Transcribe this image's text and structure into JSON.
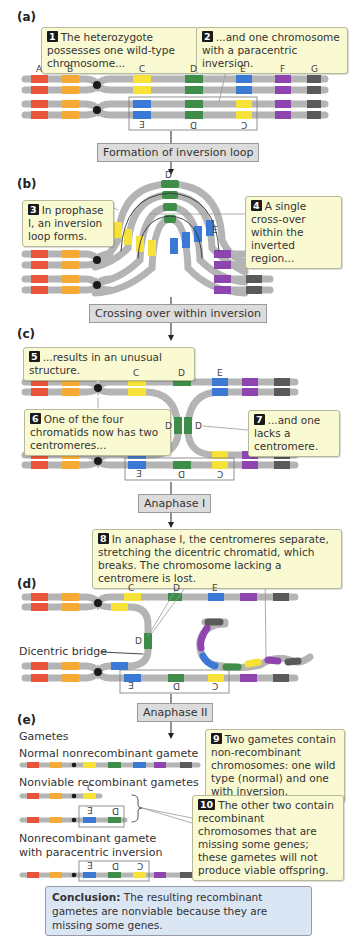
{
  "panels": {
    "a": "(a)",
    "b": "(b)",
    "c": "(c)",
    "d": "(d)",
    "e": "(e)"
  },
  "colors": {
    "chromosome": "#b4b4b4",
    "gene_A": "#e8553a",
    "gene_B": "#f5aa35",
    "gene_C": "#f7e23a",
    "gene_D": "#3e8e4a",
    "gene_E": "#3a7ad6",
    "gene_F": "#8e45b0",
    "gene_G": "#5a5a5a",
    "centromere": "#1a1a1a",
    "callout_bg": "#fafad2",
    "step_bg": "#dcdcdc",
    "conclusion_bg": "#dbe6f4"
  },
  "gene_labels": [
    "A",
    "B",
    "C",
    "D",
    "E",
    "F",
    "G"
  ],
  "inverted_labels": [
    "E",
    "D",
    "C"
  ],
  "steps": {
    "s1": "Formation of inversion loop",
    "s2": "Crossing over within inversion",
    "s3": "Anaphase I",
    "s4": "Anaphase II"
  },
  "callouts": {
    "c1": {
      "num": "1",
      "text": "The heterozygote possesses one wild-type chromosome..."
    },
    "c2": {
      "num": "2",
      "text": "...and one chromosome with a paracentric inversion."
    },
    "c3": {
      "num": "3",
      "text": "In prophase I, an inversion loop forms."
    },
    "c4": {
      "num": "4",
      "text": "A single cross-over within the inverted region..."
    },
    "c5": {
      "num": "5",
      "text": "...results in an unusual structure."
    },
    "c6": {
      "num": "6",
      "text": "One of the four chromatids now has two centromeres..."
    },
    "c7": {
      "num": "7",
      "text": "...and one lacks a centromere."
    },
    "c8": {
      "num": "8",
      "text": "In anaphase I, the centromeres separate, stretching the dicentric chromatid, which breaks. The chromosome lacking a centromere is lost."
    },
    "c9": {
      "num": "9",
      "text": "Two gametes contain non-recombinant chromosomes: one wild type (normal) and one with inversion."
    },
    "c10": {
      "num": "10",
      "text": "The other two contain recombinant chromosomes that are missing some genes; these gametes will not produce viable offspring."
    }
  },
  "labels": {
    "dicentric_bridge": "Dicentric bridge",
    "gametes": "Gametes",
    "normal_gamete": "Normal nonrecombinant gamete",
    "nonviable_gametes": "Nonviable recombinant gametes",
    "inversion_gamete_line1": "Nonrecombinant gamete",
    "inversion_gamete_line2": "with paracentric inversion"
  },
  "conclusion": {
    "bold": "Conclusion:",
    "text": " The resulting recombinant gametes are nonviable because they are missing some genes."
  }
}
